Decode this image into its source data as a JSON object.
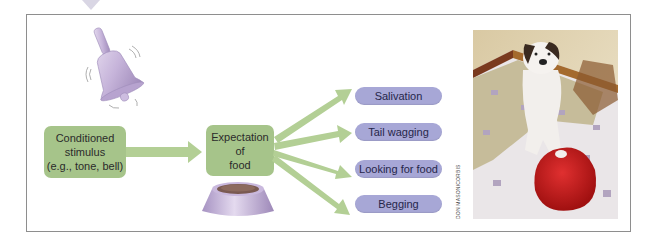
{
  "figure": {
    "credit": "DON MASON/CORBIS",
    "colors": {
      "green_box": "#a6c48a",
      "green_arrow": "#b3cf95",
      "pill": "#a7a7d6",
      "bell": "#c8b6dc",
      "bowl": "#bca9d2",
      "frame_border": "#8e8e8e",
      "red_bowl": "#c81e1e"
    }
  },
  "diagram": {
    "stimulus": {
      "icon": "bell-icon",
      "lines": [
        "Conditioned",
        "stimulus",
        "(e.g., tone, bell)"
      ]
    },
    "expectation": {
      "icon": "food-bowl-icon",
      "lines": [
        "Expectation",
        "of",
        "food"
      ]
    },
    "responses": [
      {
        "label": "Salivation"
      },
      {
        "label": "Tail wagging"
      },
      {
        "label": "Looking for food"
      },
      {
        "label": "Begging"
      }
    ]
  },
  "photo": {
    "subject": "Dog begging beside a red food bowl",
    "credit": "DON MASON/CORBIS"
  }
}
